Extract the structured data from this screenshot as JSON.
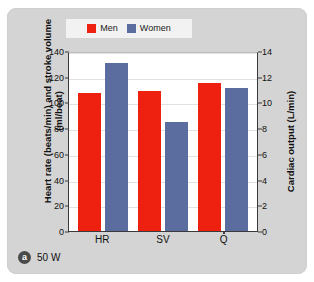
{
  "figure": {
    "caption_badge": "a",
    "caption_text": "50 W",
    "panel_background": "#d4d4d4"
  },
  "legend": {
    "position": "top-center",
    "entries": [
      {
        "label": "Men",
        "color": "#ee2010"
      },
      {
        "label": "Women",
        "color": "#5a6d9e"
      }
    ]
  },
  "chart_data": {
    "type": "bar",
    "title": "",
    "subtitle": "",
    "categories": [
      "HR",
      "SV",
      "Q̇"
    ],
    "series": [
      {
        "name": "Men",
        "color": "#ee2010",
        "values": [
          107,
          109,
          115
        ]
      },
      {
        "name": "Women",
        "color": "#5a6d9e",
        "values": [
          131,
          85,
          111
        ]
      }
    ],
    "xlabel": "",
    "ylabel": "Heart rate (beats/min) and stroke volume (ml/beat)",
    "ylim": [
      0,
      140
    ],
    "yticks": [
      0,
      20,
      40,
      60,
      80,
      100,
      120,
      140
    ],
    "y2label": "Cardiac output (L/min)",
    "y2lim": [
      0,
      14
    ],
    "y2ticks": [
      0,
      2,
      4,
      6,
      8,
      10,
      12,
      14
    ],
    "grid": true
  }
}
